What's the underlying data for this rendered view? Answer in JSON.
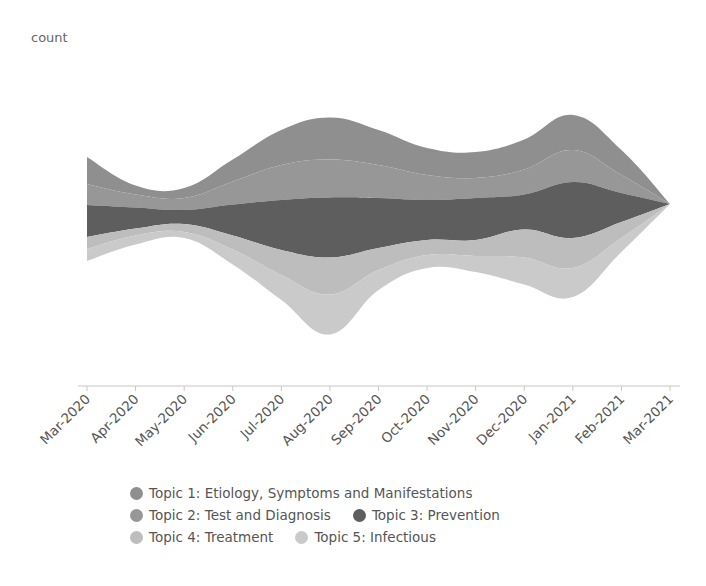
{
  "chart_data": {
    "type": "area",
    "subtype": "streamgraph",
    "title": "",
    "xlabel": "",
    "ylabel": "count",
    "categories": [
      "Mar-2020",
      "Apr-2020",
      "May-2020",
      "Jun-2020",
      "Jul-2020",
      "Aug-2020",
      "Sep-2020",
      "Oct-2020",
      "Nov-2020",
      "Dec-2020",
      "Jan-2021",
      "Feb-2021",
      "Mar-2021"
    ],
    "baseline_center": [
      209,
      215,
      213,
      212,
      215,
      226,
      210,
      208,
      212,
      212,
      206,
      201,
      204
    ],
    "series": [
      {
        "name": "Topic 1:  Etiology, Symptoms and Manifestations",
        "color": "#8f8f8f",
        "values": [
          27,
          9,
          10,
          22,
          35,
          42,
          35,
          27,
          26,
          30,
          35,
          25,
          0
        ]
      },
      {
        "name": "Topic 2:  Test and Diagnosis",
        "color": "#979797",
        "values": [
          21,
          13,
          12,
          23,
          35,
          38,
          33,
          25,
          20,
          25,
          32,
          18,
          0
        ]
      },
      {
        "name": "Topic 3:  Prevention",
        "color": "#5e5e5e",
        "values": [
          32,
          21,
          14,
          31,
          50,
          60,
          50,
          40,
          42,
          35,
          56,
          29,
          0
        ]
      },
      {
        "name": "Topic 4:  Treatment",
        "color": "#bdbdbd",
        "values": [
          12,
          7,
          8,
          14,
          25,
          37,
          22,
          15,
          16,
          28,
          30,
          16,
          0
        ]
      },
      {
        "name": "Topic 5:  Infectious",
        "color": "#cacaca",
        "values": [
          12,
          9,
          6,
          15,
          25,
          40,
          20,
          13,
          16,
          27,
          29,
          14,
          0
        ]
      }
    ],
    "grid": false,
    "legend_position": "bottom"
  },
  "axis": {
    "ylabel": "count"
  },
  "legend": {
    "rows": [
      [
        0
      ],
      [
        1,
        2
      ],
      [
        3,
        4
      ]
    ]
  }
}
